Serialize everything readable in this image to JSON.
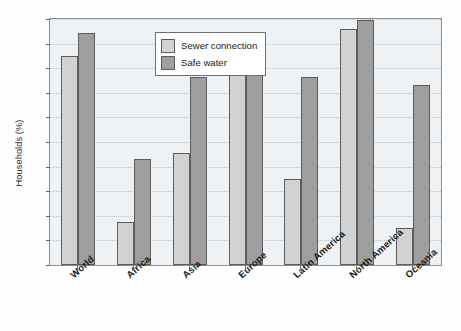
{
  "chart_data": {
    "type": "bar",
    "title": "",
    "xlabel": "",
    "ylabel": "Households (%)",
    "ylim": [
      0,
      100
    ],
    "ytick_step": 10,
    "ytick_labels": [
      "0",
      "10",
      "20",
      "30",
      "40",
      "50",
      "60",
      "70",
      "80",
      "90",
      "100"
    ],
    "grid": true,
    "legend_position": "top-left-inside",
    "categories": [
      "World",
      "Africa",
      "Asia",
      "Europe",
      "Latin America",
      "North America",
      "Oceania"
    ],
    "series": [
      {
        "name": "Sewer connection",
        "color": "#d2d2d2",
        "values": [
          85,
          17.5,
          45.5,
          92,
          35,
          96,
          15
        ]
      },
      {
        "name": "Safe water",
        "color": "#9e9e9e",
        "values": [
          94.5,
          43,
          76.5,
          92,
          76.5,
          99.5,
          73
        ]
      }
    ]
  },
  "legend": {
    "items": [
      {
        "label": "Sewer connection",
        "color": "#d2d2d2"
      },
      {
        "label": "Safe water",
        "color": "#9e9e9e"
      }
    ]
  },
  "colors": {
    "plot_background": "#eef2f5",
    "figure_background": "#fefefe",
    "axis": "#8d8d8d",
    "gridline": "#b9c3c9",
    "bar_border": "#5c5c5c"
  }
}
